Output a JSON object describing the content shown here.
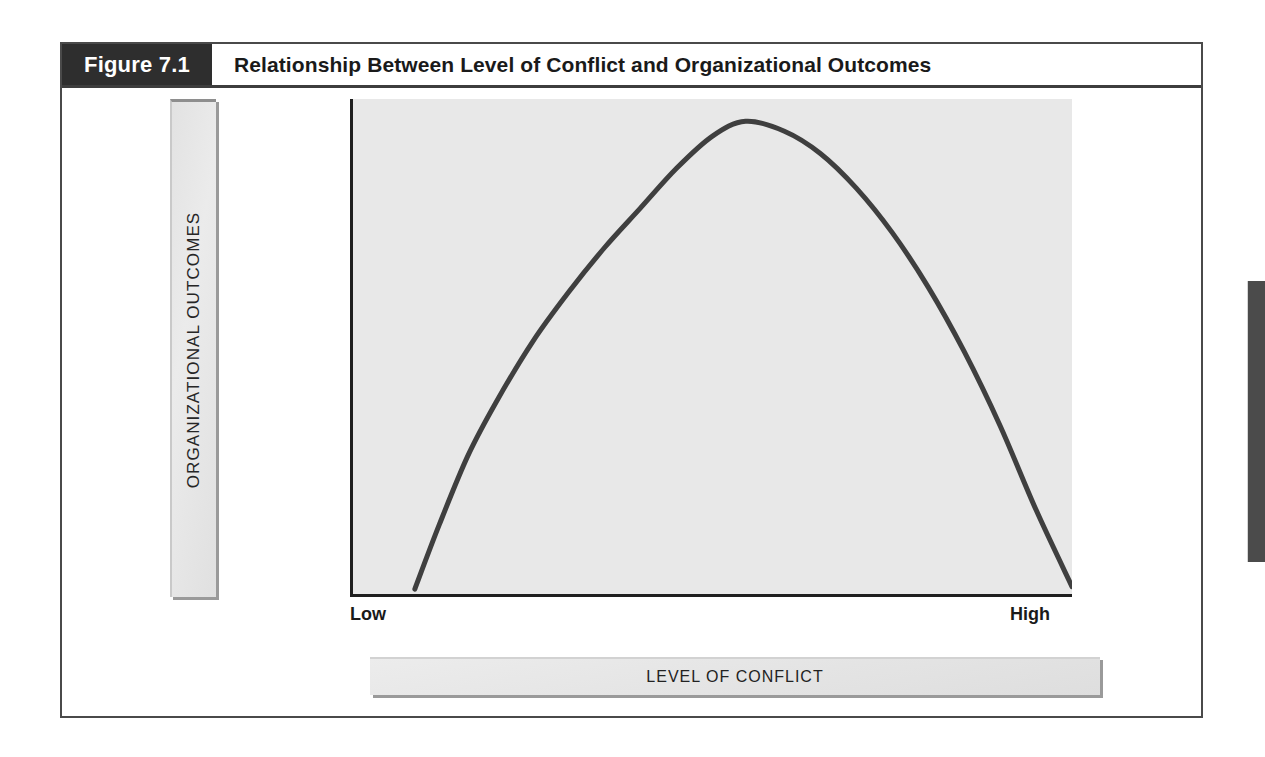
{
  "figure": {
    "number_label": "Figure 7.1",
    "title": "Relationship Between Level of Conflict and Organizational Outcomes"
  },
  "axes": {
    "y_title": "ORGANIZATIONAL OUTCOMES",
    "x_title": "LEVEL OF CONFLICT",
    "y_top_label": "Positive",
    "y_bottom_label": "Negative",
    "x_left_label": "Low",
    "x_right_label": "High"
  },
  "colors": {
    "header_block": "#2e2e2e",
    "frame_border": "#4a4a4a",
    "plot_background": "#e8e8e8",
    "curve": "#3f3f3f",
    "axis_line": "#1f1f1f",
    "axis_bar": "#e6e6e6",
    "page_tab": "#4b4b4b"
  },
  "chart_data": {
    "type": "line",
    "title": "Relationship Between Level of Conflict and Organizational Outcomes",
    "xlabel": "LEVEL OF CONFLICT",
    "ylabel": "ORGANIZATIONAL OUTCOMES",
    "xtick_labels": [
      "Low",
      "High"
    ],
    "ytick_labels": [
      "Negative",
      "Positive"
    ],
    "xlim": [
      0,
      100
    ],
    "ylim": [
      0,
      100
    ],
    "grid": false,
    "legend": null,
    "annotation": "Inverted-U curve: organizational outcomes are negative at very low conflict, rise to a positive peak at a moderate level of conflict, then fall back to negative at very high conflict.",
    "series": [
      {
        "name": "Organizational outcomes",
        "x": [
          8.6,
          12,
          16,
          20,
          25,
          30,
          35,
          40,
          45,
          50,
          54.6,
          60,
          65,
          70,
          75,
          80,
          85,
          90,
          95,
          100
        ],
        "y": [
          1.0,
          14.0,
          28.0,
          39.0,
          51.0,
          61.0,
          70.0,
          78.0,
          86.0,
          92.5,
          95.5,
          93.5,
          89.0,
          82.0,
          73.0,
          62.0,
          49.0,
          34.0,
          17.0,
          1.5
        ]
      }
    ]
  }
}
